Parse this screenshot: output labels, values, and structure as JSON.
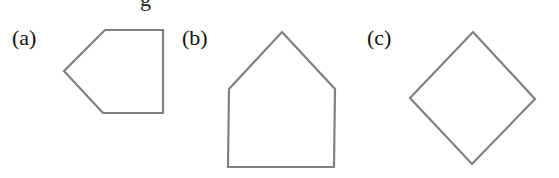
{
  "top_text_partial": "g                         ",
  "figures": [
    {
      "label": "(a)",
      "label_pos": [
        12,
        28
      ],
      "shape": "pentagon-pointing-left",
      "points": "105,30 163,30 163,113 103,113 64,71"
    },
    {
      "label": "(b)",
      "label_pos": [
        182,
        28
      ],
      "shape": "house-pentagon",
      "points": "282,32 335,89 334,167 228,167 229,89"
    },
    {
      "label": "(c)",
      "label_pos": [
        367,
        28
      ],
      "shape": "diamond-square",
      "points": "473,32 535,99 472,164 410,98"
    }
  ],
  "colors": {
    "stroke": "#808080",
    "text": "#111111"
  }
}
